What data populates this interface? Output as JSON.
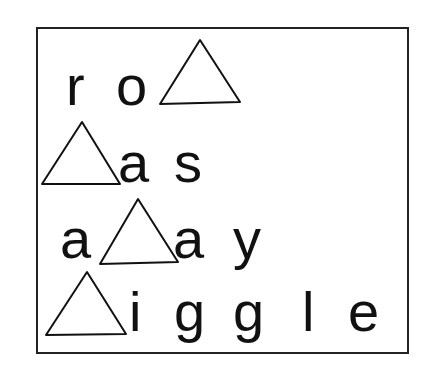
{
  "puzzle": {
    "rows": [
      {
        "letters": [
          "r",
          "o"
        ],
        "shapes": [
          "triangle"
        ]
      },
      {
        "letters": [
          "a",
          "s"
        ],
        "shapes": [
          "triangle"
        ]
      },
      {
        "letters": [
          "a",
          "a",
          "y"
        ],
        "shapes": [
          "triangle"
        ]
      },
      {
        "letters": [
          "i",
          "g",
          "g",
          "l",
          "e"
        ],
        "shapes": [
          "triangle"
        ]
      }
    ]
  }
}
